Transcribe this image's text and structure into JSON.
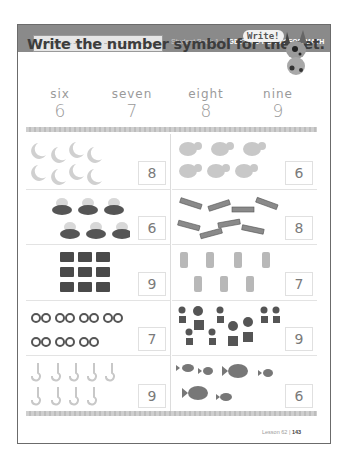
{
  "header": {
    "name_field_placeholder": "",
    "book_label": "Student Book 1",
    "separator": "|",
    "book_title": "GETTING READY FOR MATH"
  },
  "instruction": "Write the number symbol for the set.",
  "mascot": {
    "speech": "Write!",
    "icon": "dog-mascot-icon"
  },
  "number_key": [
    {
      "word": "six",
      "digit": "6"
    },
    {
      "word": "seven",
      "digit": "7"
    },
    {
      "word": "eight",
      "digit": "8"
    },
    {
      "word": "nine",
      "digit": "9"
    }
  ],
  "sets": [
    {
      "object": "moon",
      "icon": "crescent-moon-icon",
      "count": 8,
      "answer": "8"
    },
    {
      "object": "elephant",
      "icon": "elephant-icon",
      "count": 6,
      "answer": "6"
    },
    {
      "object": "hen-on-nest",
      "icon": "hen-nest-icon",
      "count": 6,
      "answer": "6"
    },
    {
      "object": "stick",
      "icon": "stick-icon",
      "count": 8,
      "answer": "8"
    },
    {
      "object": "fire-truck",
      "icon": "fire-truck-icon",
      "count": 9,
      "answer": "9"
    },
    {
      "object": "fire-hydrant",
      "icon": "fire-hydrant-icon",
      "count": 7,
      "answer": "7"
    },
    {
      "object": "bicycle",
      "icon": "bicycle-icon",
      "count": 7,
      "answer": "7"
    },
    {
      "object": "potted-flower",
      "icon": "flower-pot-icon",
      "count": 9,
      "answer": "9"
    },
    {
      "object": "hook",
      "icon": "hook-icon",
      "count": 9,
      "answer": "9"
    },
    {
      "object": "fish",
      "icon": "fish-icon",
      "count": 6,
      "answer": "6"
    }
  ],
  "footer": {
    "lesson": "Lesson 62",
    "separator": "|",
    "page": "143"
  }
}
